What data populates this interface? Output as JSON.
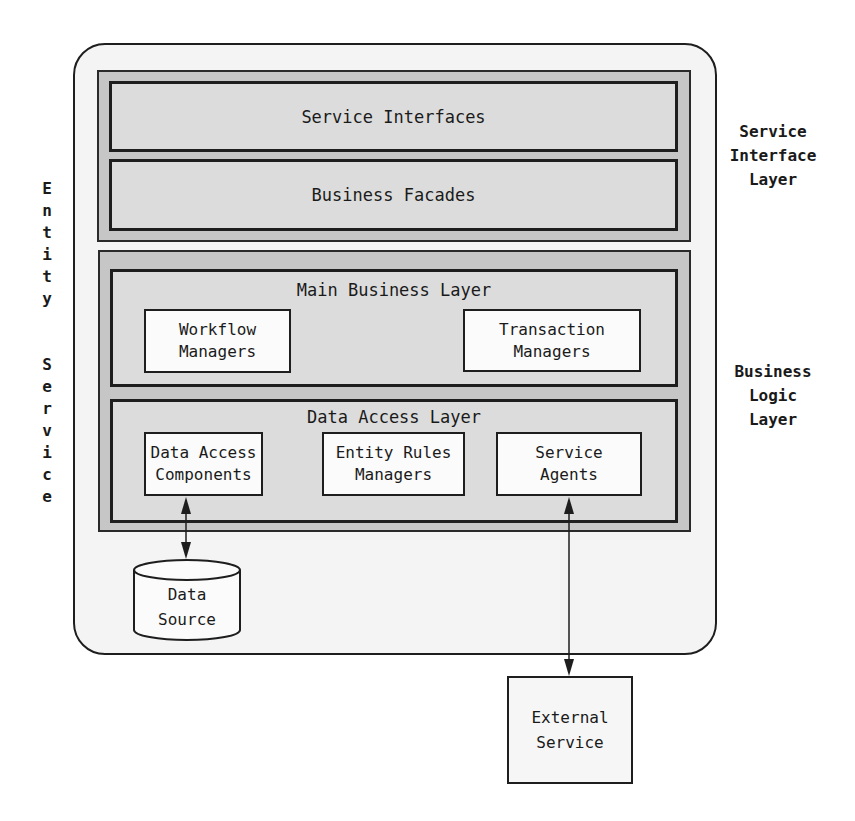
{
  "diagram": {
    "container_label_letters": [
      "E",
      "n",
      "t",
      "i",
      "t",
      "y",
      " ",
      "S",
      "e",
      "r",
      "v",
      "i",
      "c",
      "e"
    ],
    "container_label": "Entity Service",
    "service_interface_layer": {
      "side_label": "Service\nInterface\nLayer",
      "components": [
        {
          "label": "Service Interfaces"
        },
        {
          "label": "Business Facades"
        }
      ]
    },
    "business_logic_layer": {
      "side_label": "Business\nLogic\nLayer",
      "main_business_layer": {
        "title": "Main Business Layer",
        "components": [
          {
            "label": "Workflow\nManagers"
          },
          {
            "label": "Transaction\nManagers"
          }
        ]
      },
      "data_access_layer": {
        "title": "Data Access Layer",
        "components": [
          {
            "label": "Data Access\nComponents"
          },
          {
            "label": "Entity Rules\nManagers"
          },
          {
            "label": "Service\nAgents"
          }
        ]
      }
    },
    "data_source": {
      "label": "Data\nSource"
    },
    "external_service": {
      "label": "External\nService"
    },
    "connections": [
      {
        "from": "Data Access Components",
        "to": "Data Source",
        "type": "bidirectional-arrow"
      },
      {
        "from": "Service Agents",
        "to": "External Service",
        "type": "bidirectional-arrow"
      }
    ],
    "colors": {
      "outer_fill": "#f4f4f4",
      "layer_band_fill": "#c6c6c6",
      "sublayer_fill": "#dcdcdc",
      "component_fill": "#fbfbfb",
      "stroke": "#1e1e1e"
    }
  }
}
